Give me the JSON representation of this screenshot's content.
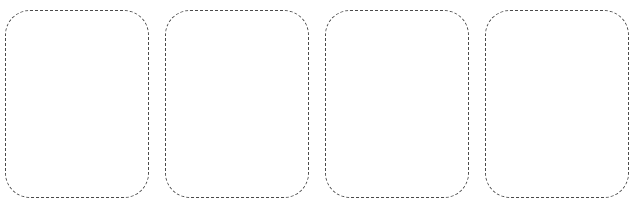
{
  "page": {
    "background_color": "#ffffff",
    "width": 637,
    "height": 207
  },
  "style": {
    "border_color": "#4a4a4a",
    "border_style": "dashed",
    "border_width_px": 1,
    "corner_radius_px": 25,
    "dash_length_px": 3,
    "dash_gap_px": 3
  },
  "placeholders": {
    "count": 4,
    "layout": "horizontal-row",
    "gap_px": 16,
    "cards": [
      {
        "index": 1,
        "label": "",
        "state": "empty"
      },
      {
        "index": 2,
        "label": "",
        "state": "empty"
      },
      {
        "index": 3,
        "label": "",
        "state": "empty"
      },
      {
        "index": 4,
        "label": "",
        "state": "empty"
      }
    ]
  }
}
